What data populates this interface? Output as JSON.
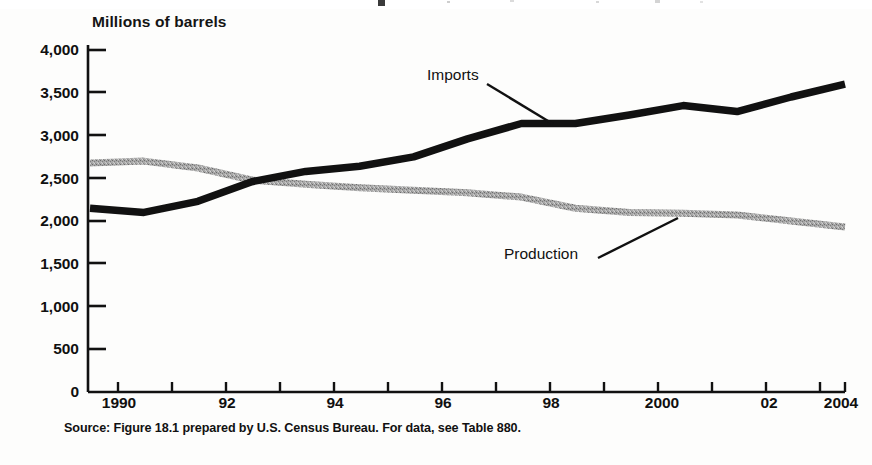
{
  "figure": {
    "axis_title": "Millions of barrels",
    "source_note": "Source: Figure 18.1 prepared by U.S. Census Bureau.  For data, see Table 880.",
    "imports_label": "Imports",
    "production_label": "Production"
  },
  "chart_data": {
    "type": "line",
    "title": "",
    "subtitle": "",
    "xlabel": "",
    "ylabel": "Millions of barrels",
    "xlim": [
      1990,
      2004
    ],
    "ylim": [
      0,
      4000
    ],
    "grid": false,
    "legend_position": "inline-annotation",
    "x": [
      1990,
      1991,
      1992,
      1993,
      1994,
      1995,
      1996,
      1997,
      1998,
      1999,
      2000,
      2001,
      2002,
      2003,
      2004
    ],
    "xtick_values": [
      1990,
      1991,
      1992,
      1993,
      1994,
      1995,
      1996,
      1997,
      1998,
      1999,
      2000,
      2001,
      2002,
      2003,
      2004
    ],
    "xtick_labels": [
      "1990",
      "",
      "92",
      "",
      "94",
      "",
      "96",
      "",
      "98",
      "",
      "2000",
      "",
      "02",
      "",
      "2004"
    ],
    "ytick_values": [
      0,
      500,
      1000,
      1500,
      2000,
      2500,
      3000,
      3500,
      4000
    ],
    "ytick_labels": [
      "0",
      "500",
      "1,000",
      "1,500",
      "2,000",
      "2,500",
      "3,000",
      "3,500",
      "4,000"
    ],
    "series": [
      {
        "name": "Imports",
        "color": "#111111",
        "values": [
          2150,
          2100,
          2230,
          2460,
          2580,
          2640,
          2750,
          2960,
          3140,
          3140,
          3240,
          3350,
          3280,
          3450,
          3600
        ]
      },
      {
        "name": "Production",
        "color": "#9a9a9a",
        "values": [
          2680,
          2700,
          2620,
          2480,
          2430,
          2390,
          2360,
          2330,
          2280,
          2150,
          2100,
          2090,
          2070,
          2000,
          1930
        ]
      }
    ],
    "annotations": [
      {
        "text": "Imports",
        "x": 1997.0,
        "y": 3560,
        "leader_to": [
          1998.0,
          3140
        ]
      },
      {
        "text": "Production",
        "x": 1996.6,
        "y": 1490,
        "leader_to": [
          1999.4,
          2150
        ]
      }
    ]
  }
}
